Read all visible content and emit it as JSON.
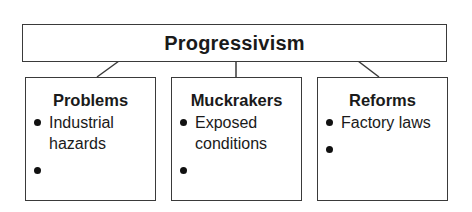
{
  "title": "Progressivism",
  "categories": [
    {
      "heading": "Problems",
      "items": [
        "Industrial hazards",
        ""
      ]
    },
    {
      "heading": "Muckrakers",
      "items": [
        "Exposed conditions",
        ""
      ]
    },
    {
      "heading": "Reforms",
      "items": [
        "Factory laws",
        ""
      ]
    }
  ],
  "colors": {
    "stroke": "#3a3a3a",
    "text": "#1a1a1a"
  }
}
